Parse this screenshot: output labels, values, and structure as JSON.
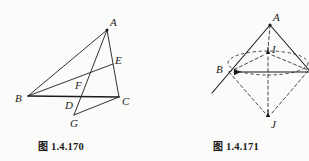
{
  "page": {
    "background": "#fbfbfa",
    "ink": "#1b1b1b",
    "width": 309,
    "height": 161
  },
  "figures": [
    {
      "id": "fig-1-4-170",
      "caption_cjk": "图",
      "caption_number": "1.4.170",
      "caption_full": "图 1.4.170",
      "description": "triangle ABC with cevians, points D E F G",
      "points": [
        {
          "name": "A",
          "label": "A",
          "x": 107,
          "y": 30,
          "label_dx": 3,
          "label_dy": -13
        },
        {
          "name": "B",
          "label": "B",
          "x": 28,
          "y": 96,
          "label_dx": -12,
          "label_dy": 1
        },
        {
          "name": "C",
          "label": "C",
          "x": 119,
          "y": 97,
          "label_dx": 4,
          "label_dy": 3
        },
        {
          "name": "D",
          "label": "D",
          "x": 73,
          "y": 97,
          "label_dx": -7,
          "label_dy": 9
        },
        {
          "name": "E",
          "label": "E",
          "x": 113,
          "y": 64,
          "label_dx": 3,
          "label_dy": -5
        },
        {
          "name": "F",
          "label": "F",
          "x": 78,
          "y": 87,
          "label_dx": -2,
          "label_dy": -3
        },
        {
          "name": "G",
          "label": "G",
          "x": 74,
          "y": 115,
          "label_dx": -3,
          "label_dy": 11
        }
      ],
      "segments": [
        {
          "name": "segment-B-A",
          "from": "B",
          "to": "A",
          "style": "solid"
        },
        {
          "name": "segment-A-C",
          "from": "A",
          "to": "C",
          "style": "solid"
        },
        {
          "name": "segment-B-C",
          "from": "B",
          "to": "C",
          "style": "solid"
        },
        {
          "name": "segment-B-E",
          "from": "B",
          "to": "E",
          "style": "solid"
        },
        {
          "name": "segment-A-G",
          "from": "A",
          "to": "G",
          "style": "solid"
        },
        {
          "name": "segment-G-C",
          "from": "G",
          "to": "C",
          "style": "solid"
        }
      ]
    },
    {
      "id": "fig-1-4-171",
      "caption_cjk": "图",
      "caption_number": "1.4.171",
      "caption_full": "图 1.4.171",
      "description": "cone-like solid: apex A, point B on base circle, axis through I to J",
      "points": [
        {
          "name": "A",
          "label": "A",
          "x": 270,
          "y": 24,
          "label_dx": 3,
          "label_dy": -12
        },
        {
          "name": "B",
          "label": "B",
          "x": 229,
          "y": 72,
          "label_dx": -12,
          "label_dy": -2
        },
        {
          "name": "I",
          "label": "I",
          "x": 268,
          "y": 54,
          "label_dx": 4,
          "label_dy": -5
        },
        {
          "name": "J",
          "label": "J",
          "x": 268,
          "y": 117,
          "label_dx": 3,
          "label_dy": 10
        }
      ],
      "ellipse": {
        "cx": 268,
        "cy": 63,
        "rx": 40,
        "ry": 12,
        "style": "dashed"
      },
      "segments": [
        {
          "name": "segment-A-B-extended",
          "style": "solid"
        },
        {
          "name": "segment-horizontal-axis",
          "style": "solid"
        },
        {
          "name": "segment-A-right",
          "style": "solid"
        },
        {
          "name": "segment-A-I",
          "style": "dashed"
        },
        {
          "name": "segment-I-J",
          "style": "dashed"
        },
        {
          "name": "segment-B-J",
          "style": "dashed"
        },
        {
          "name": "segment-right-J",
          "style": "dashed"
        },
        {
          "name": "segment-B-I",
          "style": "dashed"
        },
        {
          "name": "segment-I-right",
          "style": "dashed"
        }
      ],
      "arrow_markers": [
        {
          "name": "arrowhead-at-B",
          "direction": "left"
        },
        {
          "name": "arrowhead-at-I",
          "direction": "down"
        },
        {
          "name": "arrowhead-at-J",
          "direction": "down"
        }
      ]
    }
  ]
}
